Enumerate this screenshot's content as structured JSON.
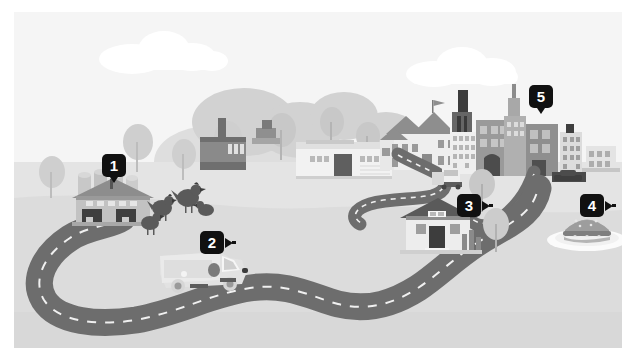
{
  "scene": {
    "title": "Farm to table supply chain illustration",
    "colors": {
      "sky": "#f3f3f3",
      "ground": "#dcdcdc",
      "ground_far": "#e6e6e6",
      "road": "#6d6d6d",
      "road_dash": "#f2f2f2",
      "cloud": "#ffffff",
      "foliage_far": "#d6d6d6",
      "foliage_mid": "#c6c6c6",
      "building_light": "#f0f0f0",
      "building_mid": "#b4b4b4",
      "building_dark": "#7d7d7d",
      "marker_bg": "#111111",
      "marker_text": "#ffffff",
      "plate": "#fbfbfb",
      "burger": "#a9a9a9"
    },
    "markers": [
      {
        "id": "marker-1",
        "label": "1",
        "pointer": "down",
        "left": 88,
        "top": 142,
        "target": "farm-barn"
      },
      {
        "id": "marker-2",
        "label": "2",
        "pointer": "right",
        "left": 186,
        "top": 219,
        "target": "delivery-van"
      },
      {
        "id": "marker-3",
        "label": "3",
        "pointer": "right",
        "left": 443,
        "top": 182,
        "target": "processing-warehouse"
      },
      {
        "id": "marker-4",
        "label": "4",
        "pointer": "right",
        "left": 566,
        "top": 182,
        "target": "burger-on-plate"
      },
      {
        "id": "marker-5",
        "label": "5",
        "pointer": "down",
        "left": 515,
        "top": 73,
        "target": "city-skyline"
      }
    ],
    "elements": {
      "cloud_left": "cloud",
      "cloud_right": "cloud",
      "farm_barn": "barn",
      "silos": "grain-silos",
      "chickens": "chickens",
      "delivery_van": "delivery-van",
      "semi_truck": "semi-truck",
      "long_warehouse": "long-warehouse",
      "factory": "factory-with-smokestack",
      "processing_warehouse": "processing-warehouse",
      "town_hall": "town-hall",
      "city_skyline": "city-skyline",
      "burger": "burger-on-plate",
      "road": "winding-road"
    }
  }
}
